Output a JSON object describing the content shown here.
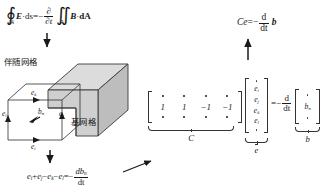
{
  "figure": {
    "accent_color": "#333333",
    "cube_fill": "#cfcfcf",
    "cube_fill_light": "#dcdcdc",
    "cube_fill_dark": "#bcbcbc"
  },
  "equations": {
    "faraday": {
      "name": "faraday-integral-law",
      "contour_integral_symbol": "∮",
      "contour_limit": "∂A",
      "lhs_field": "E",
      "lhs_dot": "·",
      "lhs_diff": "ds",
      "equals": "=",
      "minus": "−",
      "partial_num": "∂",
      "partial_den": "∂t",
      "double_integral_symbol": "∬",
      "surface_limit": "A",
      "rhs_field": "B",
      "rhs_dot": "·",
      "rhs_diff": "dA"
    },
    "compact": {
      "name": "compact-matrix-form",
      "lhs": "Ce",
      "equals": "=",
      "minus": "−",
      "frac_num": "d",
      "frac_den": "dt",
      "rhs": "b"
    },
    "scalar": {
      "name": "scalar-edge-sum",
      "terms": [
        "e",
        "+",
        "e",
        "−",
        "e",
        "−",
        "e"
      ],
      "subs": [
        "i",
        "",
        "j",
        "",
        "k",
        "",
        "l"
      ],
      "equals": "=",
      "minus": "−",
      "frac_num": "db",
      "frac_num_sub": "n",
      "frac_den": "dt"
    }
  },
  "matrix_equation": {
    "name": "matrix-equation",
    "C_matrix": {
      "label": "C",
      "visible_row": [
        "1",
        "1",
        "−1",
        "−1"
      ],
      "ellipsis_rows": 2
    },
    "e_vector": {
      "label": "e",
      "entries": [
        "e",
        "e",
        "e",
        "e"
      ],
      "subs": [
        "i",
        "j",
        "k",
        "l"
      ],
      "ellipsis_rows": 2
    },
    "operator": {
      "equals": "=",
      "minus": "−",
      "frac_num": "d",
      "frac_den": "dt"
    },
    "b_vector": {
      "label": "b",
      "entries": [
        "b"
      ],
      "subs": [
        "n"
      ],
      "ellipsis_rows": 2
    }
  },
  "diagram": {
    "name": "dual-grid-cube",
    "labels": {
      "dual_grid": "伴随网格",
      "base_grid": "基网格"
    },
    "edges": [
      {
        "name": "edge-e-k",
        "symbol": "e",
        "sub": "k"
      },
      {
        "name": "edge-e-l",
        "symbol": "e",
        "sub": "l"
      },
      {
        "name": "edge-e-j",
        "symbol": "e",
        "sub": "j"
      },
      {
        "name": "edge-e-i",
        "symbol": "e",
        "sub": "i"
      }
    ],
    "flux": {
      "name": "flux-b-n",
      "symbol": "b",
      "sub": "n"
    }
  },
  "arrows": [
    {
      "name": "arrow-faraday-to-cube",
      "direction": "down"
    },
    {
      "name": "arrow-cube-to-scalar",
      "direction": "down"
    },
    {
      "name": "arrow-scalar-to-matrix",
      "direction": "up-right"
    },
    {
      "name": "arrow-matrix-to-compact",
      "direction": "up"
    }
  ]
}
